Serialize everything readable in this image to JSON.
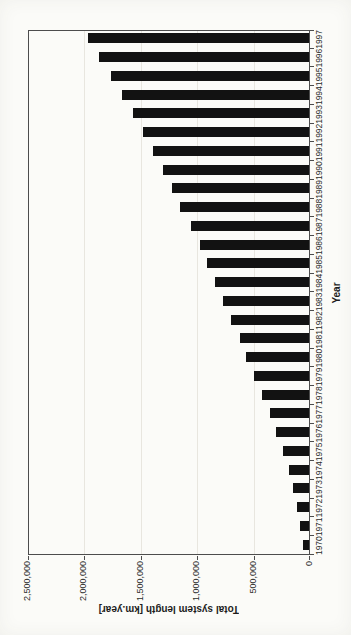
{
  "page": {
    "kind": "scanned page with rotated chart",
    "background": "#fbfbf8"
  },
  "chart_data": {
    "type": "bar",
    "title": "",
    "xlabel": "Year",
    "ylabel": "Total system length [km.year]",
    "categories": [
      "1970",
      "1971",
      "1972",
      "1973",
      "1974",
      "1975",
      "1976",
      "1977",
      "1978",
      "1979",
      "1980",
      "1981",
      "1982",
      "1983",
      "1984",
      "1985",
      "1986",
      "1987",
      "1988",
      "1989",
      "1990",
      "1991",
      "1992",
      "1993",
      "1994",
      "1995",
      "1996",
      "1997"
    ],
    "values": [
      50000,
      80000,
      105000,
      140000,
      180000,
      235000,
      290000,
      350000,
      415000,
      490000,
      560000,
      615000,
      690000,
      765000,
      830000,
      900000,
      970000,
      1050000,
      1140000,
      1215000,
      1295000,
      1385000,
      1470000,
      1560000,
      1660000,
      1755000,
      1860000,
      1960000
    ],
    "ylim": [
      0,
      2500000
    ],
    "ytick_interval": 500000,
    "ytick_labels": [
      "0",
      "500,000",
      "1,000,000",
      "1,500,000",
      "2,000,000",
      "2,500,000"
    ],
    "bar_color": "#121212",
    "legend": "none",
    "grid": "major value gridlines only, light gray",
    "layout_note": "vertical bar chart rotated 90 degrees counter-clockwise on the page; year labels read bottom-to-top, value-axis title appears upside down"
  }
}
